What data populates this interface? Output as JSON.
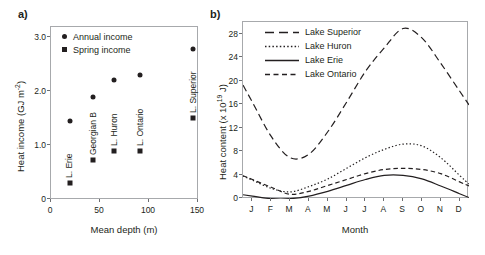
{
  "figure": {
    "panel_a_label": "a)",
    "panel_b_label": "b)"
  },
  "panel_a": {
    "legend": [
      {
        "marker": "circle",
        "label": "Annual income"
      },
      {
        "marker": "square",
        "label": "Spring income"
      }
    ],
    "axis": {
      "xlabel": "Mean depth (m)",
      "ylabel_prefix": "Heat income (GJ m",
      "ylabel_exp": "-2",
      "ylabel_suffix": ")",
      "xticks": [
        "0",
        "50",
        "100",
        "150"
      ],
      "yticks": [
        "0",
        "1.0",
        "2.0",
        "3.0"
      ]
    },
    "point_labels": [
      "L. Erie",
      "Georgian B",
      "L. Huron",
      "L. Ontario",
      "L. Superior"
    ]
  },
  "panel_b": {
    "legend": [
      {
        "style": "long-dash",
        "label": "Lake Superior"
      },
      {
        "style": "dotted",
        "label": "Lake Huron"
      },
      {
        "style": "solid",
        "label": "Lake Erie"
      },
      {
        "style": "dashed",
        "label": "Lake Ontario"
      }
    ],
    "axis": {
      "xlabel": "Month",
      "ylabel_prefix": "Heat content (x 10",
      "ylabel_exp": "19",
      "ylabel_suffix": " J)",
      "xticks": [
        "J",
        "F",
        "M",
        "A",
        "M",
        "J",
        "J",
        "A",
        "S",
        "O",
        "N",
        "D"
      ],
      "yticks": [
        "0",
        "4",
        "8",
        "12",
        "16",
        "20",
        "24",
        "28"
      ]
    }
  },
  "chart_data": [
    {
      "type": "scatter",
      "panel": "a)",
      "title": "",
      "xlabel": "Mean depth (m)",
      "ylabel": "Heat income (GJ m-2)",
      "xlim": [
        0,
        150
      ],
      "ylim": [
        0,
        3.4
      ],
      "xticks": [
        0,
        50,
        100,
        150
      ],
      "yticks": [
        0,
        1.0,
        2.0,
        3.0
      ],
      "grid": false,
      "legend_position": "top-left",
      "categories": [
        "L. Erie",
        "Georgian B",
        "L. Huron",
        "L. Ontario",
        "L. Superior"
      ],
      "x": [
        20,
        44,
        65,
        91,
        145
      ],
      "series": [
        {
          "name": "Annual income",
          "marker": "circle",
          "values": [
            1.45,
            1.88,
            2.2,
            2.3,
            2.78
          ]
        },
        {
          "name": "Spring income",
          "marker": "square",
          "values": [
            0.3,
            0.72,
            0.89,
            0.89,
            1.5
          ]
        }
      ]
    },
    {
      "type": "line",
      "panel": "b)",
      "title": "",
      "xlabel": "Month",
      "ylabel": "Heat content (x 1019 J)",
      "x": [
        "J",
        "F",
        "M",
        "A",
        "M",
        "J",
        "J",
        "A",
        "S",
        "O",
        "N",
        "D"
      ],
      "xlim": [
        0.5,
        12.5
      ],
      "ylim": [
        0,
        30
      ],
      "yticks": [
        0,
        4,
        8,
        12,
        16,
        20,
        24,
        28
      ],
      "grid": false,
      "legend_position": "top-left",
      "series": [
        {
          "name": "Lake Superior",
          "style": "long-dash",
          "values": [
            16.4,
            10.6,
            7.0,
            7.6,
            11.4,
            16.4,
            21.6,
            25.6,
            28.9,
            27.3,
            23.0,
            18.3
          ]
        },
        {
          "name": "Lake Huron",
          "style": "dotted",
          "values": [
            3.2,
            1.8,
            1.2,
            2.1,
            3.4,
            5.2,
            7.0,
            8.4,
            9.3,
            9.0,
            7.0,
            4.0
          ]
        },
        {
          "name": "Lake Erie",
          "style": "solid",
          "values": [
            0.5,
            0.05,
            0.05,
            0.5,
            1.3,
            2.3,
            3.3,
            4.0,
            4.0,
            3.4,
            2.2,
            0.9
          ]
        },
        {
          "name": "Lake Ontario",
          "style": "dashed",
          "values": [
            3.3,
            2.0,
            0.8,
            1.3,
            2.3,
            3.3,
            4.3,
            5.0,
            5.2,
            5.0,
            4.3,
            2.9
          ]
        }
      ]
    }
  ]
}
